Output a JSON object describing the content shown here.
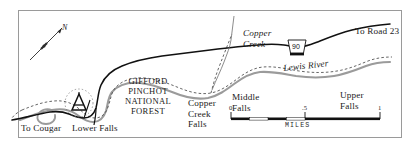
{
  "figure": {
    "kind": "recreation-map",
    "width": 415,
    "height": 148,
    "background": "#ffffff",
    "frame_color": "#9a9a9a"
  },
  "colors": {
    "road": "#000000",
    "river": "#9b9b9b",
    "trail": "#4a4a4a",
    "text": "#1a1a1a",
    "frame": "#9a9a9a",
    "shield_fill": "#ffffff",
    "scalebar_fill": "#000000"
  },
  "compass": {
    "label": "N",
    "direction": "northeast"
  },
  "labels": {
    "to_cougar": "To Cougar",
    "lower_falls": "Lower Falls",
    "copper_creek_falls": "Copper\nCreek\nFalls",
    "middle_falls": "Middle\nFalls",
    "upper_falls": "Upper\nFalls",
    "to_road_23": "To Road 23",
    "copper_creek": "Copper\nCreek",
    "lewis_river": "Lewis River",
    "forest_name": "GIFFORD\nPINCHOT\nNATIONAL\nFOREST"
  },
  "route_shield": {
    "number": "90",
    "shape": "trapezoid-forest-route"
  },
  "campground": {
    "symbol": "tent-icon",
    "near": "Lower Falls"
  },
  "scale_bar": {
    "ticks": [
      "0",
      ".5",
      "1"
    ],
    "units": "MILES",
    "segments": 4
  }
}
